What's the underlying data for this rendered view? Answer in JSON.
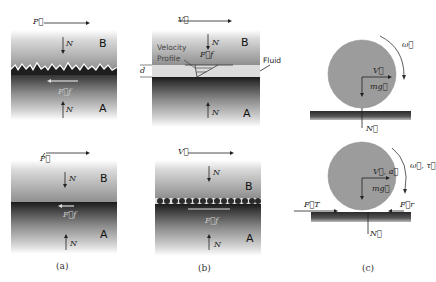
{
  "figure": {
    "panels": [
      {
        "id": "a",
        "caption": "(a)",
        "top": {
          "force_label": "P⃗",
          "top_block": "B",
          "bottom_block": "A",
          "normal_top": "N",
          "normal_bottom": "N",
          "friction": "F⃗f",
          "interface": "rough asperities"
        },
        "bottom": {
          "force_label": "P⃗",
          "top_block": "B",
          "bottom_block": "A",
          "normal_top": "N",
          "normal_bottom": "N",
          "friction": "F⃗f",
          "interface": "smooth"
        }
      },
      {
        "id": "b",
        "caption": "(b)",
        "top": {
          "force_label": "V⃗",
          "top_block": "B",
          "bottom_block": "A",
          "normal_top": "N",
          "normal_bottom": "N",
          "friction": "F⃗f",
          "velocity_profile_label_1": "Velocity",
          "velocity_profile_label_2": "Profile",
          "fluid_label": "Fluid",
          "gap_label": "d"
        },
        "bottom": {
          "force_label": "V⃗",
          "top_block": "B",
          "bottom_block": "A",
          "normal_top": "N",
          "normal_bottom": "N",
          "friction": "F⃗f",
          "interface": "rolling particles"
        }
      },
      {
        "id": "c",
        "caption": "(c)",
        "top": {
          "rotation": "ω⃗",
          "velocity": "V⃗",
          "weight": "mg⃗",
          "normal": "N⃗"
        },
        "bottom": {
          "rotation": "ω⃗, τ⃗",
          "velocity": "V⃗, a⃗",
          "weight": "mg⃗",
          "normal": "N⃗",
          "applied_force": "F⃗T",
          "rolling_friction": "F⃗r"
        }
      }
    ]
  }
}
